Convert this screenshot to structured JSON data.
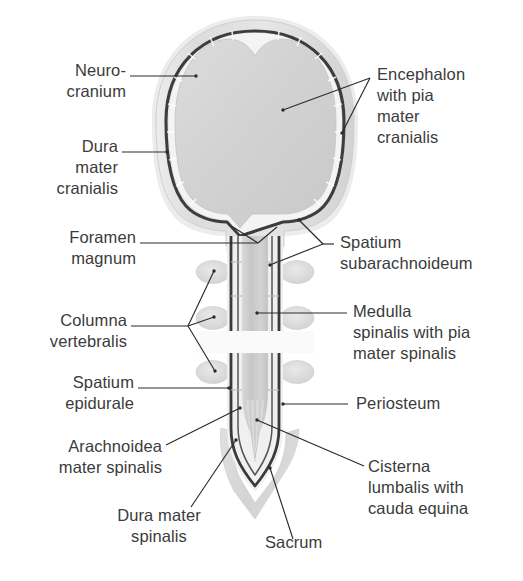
{
  "figure": {
    "colors": {
      "background": "#ffffff",
      "text": "#3b3b3b",
      "leader_line": "#2b2b2b",
      "neurocranium_bone": "#dcdcdc",
      "dura_line": "#3c3c3c",
      "encephalon_fill": "#d4d4d4",
      "subarachnoid_space": "#f2f2f2",
      "medulla_spinalis": "#cccccc",
      "vertebral_body": "#dedede",
      "sacrum": "#dadada",
      "periosteum": "#c9c9c9"
    }
  },
  "labels": {
    "neurocranium": "Neuro-\ncranium",
    "dura_mater_cranialis": "Dura\nmater\ncranialis",
    "foramen_magnum": "Foramen\nmagnum",
    "columna_vertebralis": "Columna\nvertebralis",
    "spatium_epidurale": "Spatium\nepidurale",
    "arachnoidea_mater_spinalis": "Arachnoidea\nmater spinalis",
    "dura_mater_spinalis": "Dura mater\nspinalis",
    "sacrum": "Sacrum",
    "encephalon_with_pia_mater_cranialis": "Encephalon\nwith pia\nmater\ncranialis",
    "spatium_subarachnoideum": "Spatium\nsubarachnoideum",
    "medulla_spinalis_with_pia_mater_spinalis": "Medulla\nspinalis with pia\nmater spinalis",
    "periosteum": "Periosteum",
    "cisterna_lumbalis_with_cauda_equina": "Cisterna\nlumbalis with\ncauda equina"
  },
  "structures": [
    {
      "name": "neurocranium",
      "side": "left"
    },
    {
      "name": "dura-mater-cranialis",
      "side": "left"
    },
    {
      "name": "foramen-magnum",
      "side": "left"
    },
    {
      "name": "columna-vertebralis",
      "side": "left"
    },
    {
      "name": "spatium-epidurale",
      "side": "left"
    },
    {
      "name": "arachnoidea-mater-spinalis",
      "side": "left"
    },
    {
      "name": "dura-mater-spinalis",
      "side": "bottom"
    },
    {
      "name": "sacrum",
      "side": "bottom"
    },
    {
      "name": "encephalon-with-pia-mater-cranialis",
      "side": "right"
    },
    {
      "name": "spatium-subarachnoideum",
      "side": "right"
    },
    {
      "name": "medulla-spinalis-with-pia-mater-spinalis",
      "side": "right"
    },
    {
      "name": "periosteum",
      "side": "right"
    },
    {
      "name": "cisterna-lumbalis-with-cauda-equina",
      "side": "right"
    }
  ]
}
